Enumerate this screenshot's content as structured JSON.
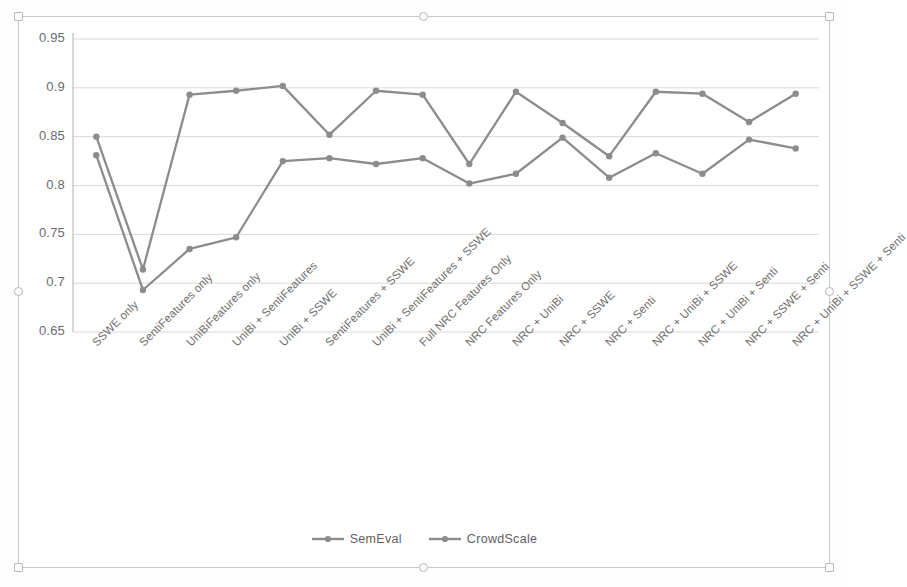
{
  "chart_data": {
    "type": "line",
    "title": "",
    "xlabel": "",
    "ylabel": "",
    "ylim": [
      0.65,
      0.95
    ],
    "ytick_step": 0.05,
    "yticks": [
      "0.95",
      "0.9",
      "0.85",
      "0.8",
      "0.75",
      "0.7",
      "0.65"
    ],
    "ytick_values": [
      0.95,
      0.9,
      0.85,
      0.8,
      0.75,
      0.7,
      0.65
    ],
    "grid": "horizontal",
    "legend_position": "bottom",
    "categories": [
      "SSWE only",
      "SentiFeatures only",
      "UniBiFeatures only",
      "UniBi + SentiFeatures",
      "UniBi + SSWE",
      "SentiFeatures + SSWE",
      "UniBi + SentiFeatures + SSWE",
      "Full NRC Features Only",
      "NRC Features Only",
      "NRC + UniBi",
      "NRC + SSWE",
      "NRC + Senti",
      "NRC + UniBi + SSWE",
      "NRC + UniBi + Senti",
      "NRC + SSWE + Senti",
      "NRC + UniBi + SSWE + Senti"
    ],
    "series": [
      {
        "name": "SemEval",
        "color": "#8c8c8c",
        "values": [
          0.831,
          0.693,
          0.735,
          0.747,
          0.825,
          0.828,
          0.822,
          0.828,
          0.802,
          0.812,
          0.849,
          0.808,
          0.833,
          0.812,
          0.847,
          0.838
        ]
      },
      {
        "name": "CrowdScale",
        "color": "#8c8c8c",
        "values": [
          0.85,
          0.714,
          0.893,
          0.897,
          0.902,
          0.852,
          0.897,
          0.893,
          0.822,
          0.896,
          0.864,
          0.83,
          0.896,
          0.894,
          0.865,
          0.894
        ]
      }
    ]
  },
  "legend": {
    "items": [
      {
        "label": "SemEval"
      },
      {
        "label": "CrowdScale"
      }
    ]
  },
  "colors": {
    "series_line": "#8c8c8c",
    "gridline": "#d8d8d8",
    "axis": "#b0b0b0",
    "tick_text": "#6b6b6b",
    "frame": "#c9c9c9"
  }
}
